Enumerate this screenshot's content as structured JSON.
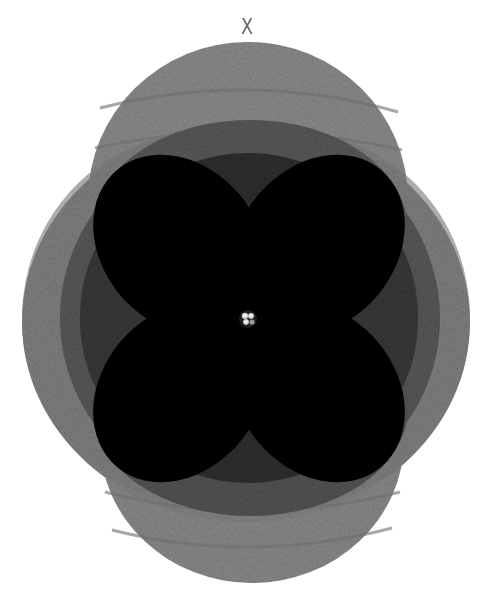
{
  "figure": {
    "title": "X",
    "colors": {
      "background": "#ffffff",
      "outer_shell": "#8a8a8a",
      "middle_shell": "#5e5e5e",
      "inner_shell": "#2e2e2e",
      "lobes": "#0b0b0b",
      "title_text": "#666666",
      "nucleus": "#f2f2f2"
    },
    "center": {
      "x": 247,
      "y": 318
    },
    "shells": [
      {
        "name": "outer-top-cap",
        "cx": 248,
        "cy": 200,
        "rx": 160,
        "ry": 158
      },
      {
        "name": "outer-bottom-cap",
        "cx": 252,
        "cy": 440,
        "rx": 152,
        "ry": 143
      },
      {
        "name": "outer-body",
        "cx": 246,
        "cy": 322,
        "rx": 224,
        "ry": 200
      },
      {
        "name": "middle-body",
        "cx": 250,
        "cy": 318,
        "rx": 190,
        "ry": 185
      },
      {
        "name": "inner-body",
        "cx": 248,
        "cy": 318,
        "rx": 165,
        "ry": 165
      }
    ],
    "lobes": [
      {
        "name": "lobe-upper-left",
        "angle": -45
      },
      {
        "name": "lobe-upper-right",
        "angle": 45
      },
      {
        "name": "lobe-lower-left",
        "angle": -135
      },
      {
        "name": "lobe-lower-right",
        "angle": 135
      }
    ]
  }
}
